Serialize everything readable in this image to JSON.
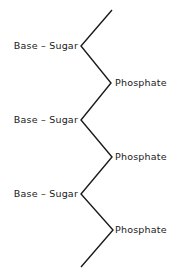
{
  "diagram": {
    "title": "",
    "backbone_color": "#1a1a1a",
    "vertices": [
      [
        112,
        10
      ],
      [
        81,
        46
      ],
      [
        111,
        83
      ],
      [
        81,
        120
      ],
      [
        112,
        157
      ],
      [
        81,
        194
      ],
      [
        113,
        230
      ],
      [
        81,
        267
      ]
    ],
    "labels": [
      {
        "text": "Base – Sugar",
        "side": "left",
        "y": 46
      },
      {
        "text": "Phosphate",
        "side": "right",
        "y": 83
      },
      {
        "text": "Base – Sugar",
        "side": "left",
        "y": 120
      },
      {
        "text": "Phosphate",
        "side": "right",
        "y": 157
      },
      {
        "text": "Base – Sugar",
        "side": "left",
        "y": 194
      },
      {
        "text": "Phosphate",
        "side": "right",
        "y": 230
      }
    ]
  }
}
